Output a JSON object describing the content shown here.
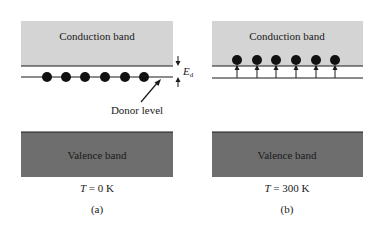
{
  "colors": {
    "conduction_band_fill": "#d4d4d4",
    "valence_band_fill": "#6e6e6e",
    "line": "#1a1a1a",
    "electron": "#111111",
    "background": "#ffffff"
  },
  "panels": [
    {
      "id": "a",
      "conduction_band_label": "Conduction band",
      "valence_band_label": "Valence band",
      "temperature_symbol": "T",
      "temperature_value": " = 0 K",
      "panel_label": "(a)",
      "donor_level_label": "Donor level",
      "energy_gap_symbol": "E",
      "energy_gap_subscript": "d",
      "electrons_count": 6,
      "electron_position": "on donor level"
    },
    {
      "id": "b",
      "conduction_band_label": "Conduction band",
      "valence_band_label": "Valence band",
      "temperature_symbol": "T",
      "temperature_value": " = 300 K",
      "panel_label": "(b)",
      "electrons_count": 6,
      "electron_position": "excited into conduction band"
    }
  ]
}
